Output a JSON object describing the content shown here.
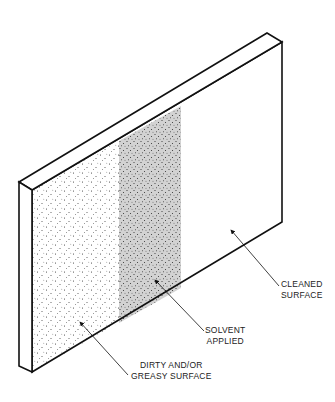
{
  "diagram": {
    "colors": {
      "outline": "#111111",
      "solvent_band": "#d2d2d2",
      "speckle": "#333333",
      "background": "#ffffff"
    },
    "regions": [
      {
        "id": "dirty",
        "description": "speckled surface"
      },
      {
        "id": "solvent",
        "description": "grey band with speckles"
      },
      {
        "id": "cleaned",
        "description": "plain white surface"
      }
    ],
    "labels": {
      "cleaned": {
        "line1": "CLEANED",
        "line2": "SURFACE"
      },
      "solvent": {
        "line1": "SOLVENT",
        "line2": "APPLIED"
      },
      "dirty": {
        "line1": "DIRTY AND/OR",
        "line2": "GREASY SURFACE"
      }
    }
  }
}
